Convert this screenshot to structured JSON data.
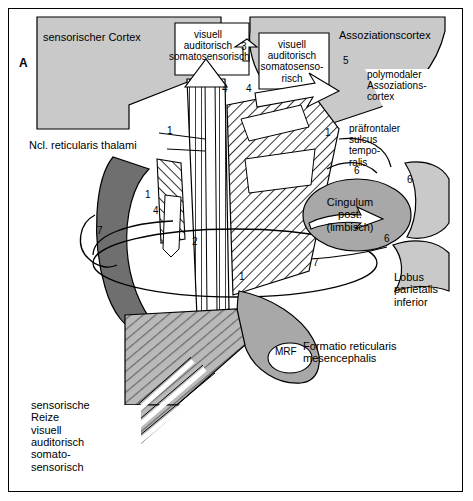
{
  "figure": {
    "panel_letter": "A",
    "labels": {
      "sensorischer_cortex": "sensorischer Cortex",
      "assoziationscortex": "Assoziationscortex",
      "box_visuell_1": "visuell\nauditorisch\nsomatosensorisch",
      "box_visuell_2": "visuell\nauditorisch\nsomatosenso-\nrisch",
      "polymodaler": "polymodaler\nAssoziations-\ncortex",
      "ncl_reticularis": "Ncl. reticularis thalami",
      "praefrontal": "präfrontaler\nsulcus\ntempo-\nralis",
      "cingulum": "Cingulum\npost.\n(limbisch)",
      "lobus": "Lobus\nparietalis\ninferior",
      "mrf": "MRF",
      "formatio": "Formatio reticularis\nmesencephalis",
      "input": "sensorische\nReize\nvisuell\nauditorisch\nsomato-\nsensorisch"
    },
    "numbers": [
      {
        "id": "n3",
        "value": "3"
      },
      {
        "id": "n4a",
        "value": "4"
      },
      {
        "id": "n4b",
        "value": "4"
      },
      {
        "id": "n5",
        "value": "5"
      },
      {
        "id": "n1top",
        "value": "1"
      },
      {
        "id": "n1mid",
        "value": "1"
      },
      {
        "id": "n1left",
        "value": "1"
      },
      {
        "id": "n4left",
        "value": "4"
      },
      {
        "id": "n2",
        "value": "2"
      },
      {
        "id": "n7left",
        "value": "7"
      },
      {
        "id": "n6a",
        "value": "6"
      },
      {
        "id": "n6b",
        "value": "6"
      },
      {
        "id": "n6c",
        "value": "6"
      },
      {
        "id": "n7right",
        "value": "7"
      },
      {
        "id": "n1bottom",
        "value": "1"
      }
    ],
    "colors": {
      "background": "#ffffff",
      "border": "#000000",
      "light_gray": "#c9c9c9",
      "mid_gray": "#a8a8a8",
      "dark_gray": "#6f6f6f",
      "hatch": "#000000"
    }
  }
}
